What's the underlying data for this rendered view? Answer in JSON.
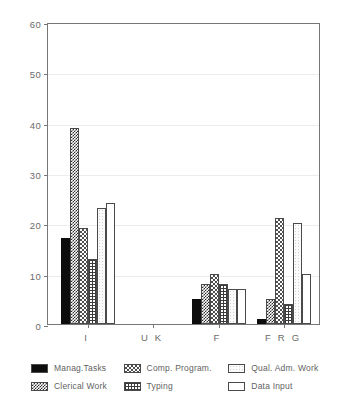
{
  "chart_data": {
    "type": "bar",
    "title": "",
    "subtitle": "",
    "xlabel": "",
    "ylabel": "",
    "categories": [
      "I",
      "U K",
      "F",
      "F R G"
    ],
    "ylim": [
      0,
      60
    ],
    "yticks": [
      0,
      10,
      20,
      30,
      40,
      50,
      60
    ],
    "grid": true,
    "legend_position": "bottom",
    "series": [
      {
        "name": "Manag.Tasks",
        "pattern": "solid-black",
        "values": [
          17,
          0,
          5,
          1
        ]
      },
      {
        "name": "Clerical Work",
        "pattern": "checker-dark",
        "values": [
          39,
          0,
          8,
          5
        ]
      },
      {
        "name": "Comp. Program.",
        "pattern": "checker-light",
        "values": [
          19,
          0,
          10,
          21
        ]
      },
      {
        "name": "Typing",
        "pattern": "grid",
        "values": [
          13,
          0,
          8,
          4
        ]
      },
      {
        "name": "Qual. Adm. Work",
        "pattern": "stipple",
        "values": [
          23,
          0,
          7,
          20
        ]
      },
      {
        "name": "Data Input",
        "pattern": "white",
        "values": [
          24,
          0,
          7,
          10
        ]
      }
    ]
  },
  "axis": {
    "y_tick_labels": [
      "60",
      "50",
      "40",
      "30",
      "20",
      "10",
      "0"
    ],
    "x_tick_labels": [
      "I",
      "U K",
      "F",
      "F R G"
    ]
  },
  "legend": {
    "items": [
      {
        "label": "Manag.Tasks"
      },
      {
        "label": "Comp. Program."
      },
      {
        "label": "Qual. Adm. Work"
      },
      {
        "label": "Clerical Work"
      },
      {
        "label": "Typing"
      },
      {
        "label": "Data Input"
      }
    ]
  },
  "colors": {
    "frame": "#777777",
    "gridline": "#ececec",
    "text": "#5f5f5f",
    "bar_outline": "#4a4a4a",
    "background": "#ffffff"
  }
}
